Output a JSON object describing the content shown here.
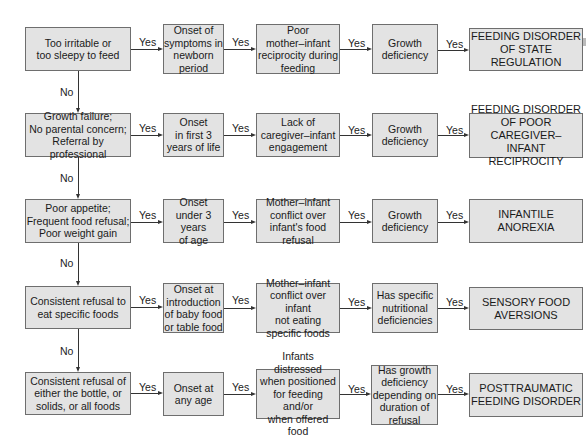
{
  "labels": {
    "yes": "Yes",
    "no": "No"
  },
  "rows": [
    {
      "criterion": "Too irritable or\ntoo sleepy to feed",
      "onset": "Onset of\nsymptoms in\nnewborn\nperiod",
      "interaction": "Poor\nmother–infant\nreciprocity during\nfeeding",
      "growth": "Growth\ndeficiency",
      "diagnosis": "FEEDING DISORDER\nOF STATE REGULATION"
    },
    {
      "criterion": "Growth failure;\nNo parental concern;\nReferral by professional",
      "onset": "Onset\nin first 3\nyears of life",
      "interaction": "Lack of\ncaregiver–infant\nengagement",
      "growth": "Growth\ndeficiency",
      "diagnosis": "FEEDING DISORDER\nOF POOR CAREGIVER–\nINFANT RECIPROCITY"
    },
    {
      "criterion": "Poor appetite;\nFrequent food refusal;\nPoor weight gain",
      "onset": "Onset\nunder 3 years\nof age",
      "interaction": "Mother–infant\nconflict over\ninfant's food refusal",
      "growth": "Growth\ndeficiency",
      "diagnosis": "INFANTILE ANOREXIA"
    },
    {
      "criterion": "Consistent refusal to\neat specific foods",
      "onset": "Onset at\nintroduction\nof baby food\nor table food",
      "interaction": "Mother–infant\nconflict over infant\nnot eating\nspecific foods",
      "growth": "Has specific\nnutritional\ndeficiencies",
      "diagnosis": "SENSORY FOOD\nAVERSIONS"
    },
    {
      "criterion": "Consistent refusal of\neither the bottle, or\nsolids, or all foods",
      "onset": "Onset at\nany age",
      "interaction": "Infants distressed\nwhen positioned\nfor feeding and/or\nwhen offered food",
      "growth": "Has growth\ndeficiency\ndepending on\nduration of\nrefusal",
      "diagnosis": "POSTTRAUMATIC\nFEEDING DISORDER"
    }
  ]
}
